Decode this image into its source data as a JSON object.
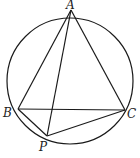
{
  "diagram": {
    "type": "geometry",
    "circle": {
      "cx": 70,
      "cy": 81,
      "r": 63
    },
    "points": [
      {
        "name": "A",
        "x": 71,
        "y": 10,
        "label_x": 65,
        "label_y": 10
      },
      {
        "name": "B",
        "x": 18,
        "y": 109,
        "label_x": 6,
        "label_y": 117
      },
      {
        "name": "C",
        "x": 125,
        "y": 110,
        "label_x": 128,
        "label_y": 118
      },
      {
        "name": "P",
        "x": 47,
        "y": 136,
        "label_x": 41,
        "label_y": 151
      }
    ],
    "segments": [
      [
        "A",
        "B"
      ],
      [
        "A",
        "C"
      ],
      [
        "B",
        "C"
      ],
      [
        "A",
        "P"
      ],
      [
        "B",
        "P"
      ],
      [
        "C",
        "P"
      ]
    ],
    "labels": {
      "A": "A",
      "B": "B",
      "C": "C",
      "P": "P"
    }
  }
}
